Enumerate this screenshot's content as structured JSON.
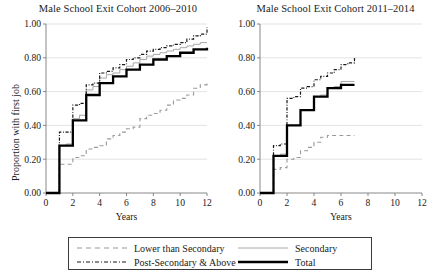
{
  "figure": {
    "ylabel": "Proportion with first job",
    "xlabel": "Years",
    "ytick_labels": [
      "0.00",
      "0.20",
      "0.40",
      "0.60",
      "0.80",
      "1.00"
    ],
    "xtick_labels": [
      "0",
      "2",
      "4",
      "6",
      "8",
      "10",
      "12"
    ]
  },
  "legend": {
    "entries": [
      {
        "key": "lower_than_secondary",
        "label": "Lower than Secondary",
        "style": "dashed",
        "color": "#9a9a9a"
      },
      {
        "key": "secondary",
        "label": "Secondary",
        "style": "solid-thin",
        "color": "#a8a8a8"
      },
      {
        "key": "post_secondary_above",
        "label": "Post-Secondary & Above",
        "style": "dash-dot",
        "color": "#1a1a1a"
      },
      {
        "key": "total",
        "label": "Total",
        "style": "solid-thick",
        "color": "#000000"
      }
    ]
  },
  "chart_data": [
    {
      "type": "line",
      "id": "cohort-2006-2010",
      "title": "Male School Exit Cohort 2006–2010",
      "xlabel": "Years",
      "ylabel": "Proportion with first job",
      "xlim": [
        0,
        12
      ],
      "ylim": [
        0,
        1.0
      ],
      "xticks": [
        0,
        2,
        4,
        6,
        8,
        10,
        12
      ],
      "yticks": [
        0.0,
        0.2,
        0.4,
        0.6,
        0.8,
        1.0
      ],
      "grid": "horizontal",
      "step": "post",
      "legend_position": "bottom",
      "series": [
        {
          "name": "Lower than Secondary",
          "style": "dashed",
          "color": "#9a9a9a",
          "x": [
            0,
            1,
            1.5,
            2,
            2.5,
            3,
            3.5,
            4,
            4.5,
            5,
            5.5,
            6,
            6.5,
            7,
            7.5,
            8,
            8.5,
            9,
            9.5,
            10,
            10.5,
            11,
            11.5,
            12
          ],
          "y": [
            0.0,
            0.17,
            0.17,
            0.21,
            0.22,
            0.26,
            0.27,
            0.28,
            0.32,
            0.34,
            0.36,
            0.38,
            0.39,
            0.44,
            0.46,
            0.47,
            0.49,
            0.52,
            0.55,
            0.56,
            0.58,
            0.62,
            0.64,
            0.66
          ]
        },
        {
          "name": "Secondary",
          "style": "solid-thin",
          "color": "#a8a8a8",
          "x": [
            0,
            1,
            1.5,
            2,
            2.5,
            3,
            3.5,
            4,
            4.5,
            5,
            5.5,
            6,
            6.5,
            7,
            7.5,
            8,
            8.5,
            9,
            9.5,
            10,
            10.5,
            11,
            11.5,
            12
          ],
          "y": [
            0.0,
            0.28,
            0.29,
            0.44,
            0.46,
            0.61,
            0.63,
            0.68,
            0.7,
            0.71,
            0.73,
            0.75,
            0.77,
            0.79,
            0.81,
            0.82,
            0.83,
            0.84,
            0.85,
            0.86,
            0.87,
            0.88,
            0.89,
            0.89
          ]
        },
        {
          "name": "Post-Secondary & Above",
          "style": "dash-dot",
          "color": "#1a1a1a",
          "x": [
            0,
            1,
            1.5,
            2,
            2.5,
            3,
            3.5,
            4,
            4.5,
            5,
            5.5,
            6,
            6.5,
            7,
            7.5,
            8,
            8.5,
            9,
            9.5,
            10,
            10.5,
            11,
            11.5,
            12
          ],
          "y": [
            0.0,
            0.36,
            0.36,
            0.52,
            0.53,
            0.64,
            0.65,
            0.71,
            0.72,
            0.74,
            0.76,
            0.79,
            0.8,
            0.82,
            0.84,
            0.85,
            0.86,
            0.87,
            0.88,
            0.89,
            0.91,
            0.93,
            0.94,
            0.98
          ]
        },
        {
          "name": "Total",
          "style": "solid-thick",
          "color": "#000000",
          "x": [
            0,
            1,
            1.5,
            2,
            2.5,
            3,
            3.5,
            4,
            4.5,
            5,
            5.5,
            6,
            6.5,
            7,
            7.5,
            8,
            8.5,
            9,
            9.5,
            10,
            10.5,
            11,
            11.5,
            12
          ],
          "y": [
            0.0,
            0.28,
            0.28,
            0.43,
            0.43,
            0.58,
            0.58,
            0.65,
            0.65,
            0.69,
            0.69,
            0.73,
            0.73,
            0.76,
            0.76,
            0.79,
            0.79,
            0.81,
            0.81,
            0.83,
            0.83,
            0.85,
            0.85,
            0.86
          ]
        }
      ]
    },
    {
      "type": "line",
      "id": "cohort-2011-2014",
      "title": "Male School Exit Cohort 2011–2014",
      "xlabel": "Years",
      "ylabel": "Proportion with first job",
      "xlim": [
        0,
        12
      ],
      "ylim": [
        0,
        1.0
      ],
      "xticks": [
        0,
        2,
        4,
        6,
        8,
        10,
        12
      ],
      "yticks": [
        0.0,
        0.2,
        0.4,
        0.6,
        0.8,
        1.0
      ],
      "grid": "horizontal",
      "step": "post",
      "legend_position": "bottom",
      "series": [
        {
          "name": "Lower than Secondary",
          "style": "dashed",
          "color": "#9a9a9a",
          "x": [
            0,
            1,
            1.5,
            2,
            2.5,
            3,
            3.5,
            4,
            4.5,
            5,
            5.5,
            6,
            6.5,
            7
          ],
          "y": [
            0.0,
            0.14,
            0.15,
            0.2,
            0.21,
            0.25,
            0.27,
            0.3,
            0.33,
            0.34,
            0.34,
            0.34,
            0.34,
            0.34
          ]
        },
        {
          "name": "Secondary",
          "style": "solid-thin",
          "color": "#a8a8a8",
          "x": [
            0,
            1,
            1.5,
            2,
            2.5,
            3,
            3.5,
            4,
            4.5,
            5,
            5.5,
            6,
            6.5,
            7
          ],
          "y": [
            0.0,
            0.22,
            0.23,
            0.4,
            0.4,
            0.49,
            0.49,
            0.57,
            0.58,
            0.62,
            0.63,
            0.66,
            0.66,
            0.66
          ]
        },
        {
          "name": "Post-Secondary & Above",
          "style": "dash-dot",
          "color": "#1a1a1a",
          "x": [
            0,
            1,
            1.5,
            2,
            2.5,
            3,
            3.5,
            4,
            4.5,
            5,
            5.5,
            6,
            6.5,
            7
          ],
          "y": [
            0.0,
            0.28,
            0.29,
            0.56,
            0.57,
            0.62,
            0.63,
            0.67,
            0.69,
            0.71,
            0.73,
            0.76,
            0.77,
            0.8
          ]
        },
        {
          "name": "Total",
          "style": "solid-thick",
          "color": "#000000",
          "x": [
            0,
            1,
            1.5,
            2,
            2.5,
            3,
            3.5,
            4,
            4.5,
            5,
            5.5,
            6,
            6.5,
            7
          ],
          "y": [
            0.0,
            0.22,
            0.22,
            0.4,
            0.4,
            0.49,
            0.49,
            0.57,
            0.57,
            0.62,
            0.62,
            0.64,
            0.64,
            0.64
          ]
        }
      ]
    }
  ]
}
